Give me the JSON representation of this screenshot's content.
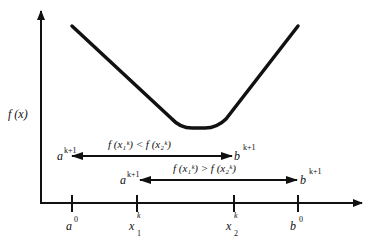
{
  "diagram": {
    "y_axis_label": "f (x)",
    "ticks": [
      {
        "base": "a",
        "sup": "0",
        "sub": ""
      },
      {
        "base": "x",
        "sup": "k",
        "sub": "1"
      },
      {
        "base": "x",
        "sup": "k",
        "sub": "2"
      },
      {
        "base": "b",
        "sup": "0",
        "sub": ""
      }
    ],
    "case_upper": {
      "condition": "f (x₁ᵏ) < f (x₂ᵏ)",
      "left_label": {
        "base": "a",
        "sup": "k+1"
      },
      "right_label": {
        "base": "b",
        "sup": "k+1"
      }
    },
    "case_lower": {
      "condition": "f (x₁ᵏ) > f (x₂ᵏ)",
      "left_label": {
        "base": "a",
        "sup": "k+1"
      },
      "right_label": {
        "base": "b",
        "sup": "k+1"
      }
    },
    "colors": {
      "stroke": "#111111",
      "background": "#ffffff"
    }
  }
}
